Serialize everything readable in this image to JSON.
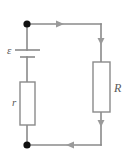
{
  "figure": {
    "name": "emf-circuit-diagram",
    "type": "electrical-circuit-schematic",
    "background_color": "#ffffff",
    "wire_color": "#8a8a8a",
    "node_color": "#101010",
    "arrow_color": "#9a9a9a",
    "label_color": "#5a5a5a"
  },
  "labels": {
    "emf": "ε",
    "internal_resistance": "r",
    "external_resistance": "R"
  },
  "components": [
    {
      "id": "battery",
      "name": "emf-source",
      "label": "ε",
      "branch": "left",
      "symbol": "battery-cell"
    },
    {
      "id": "internal-resistor",
      "name": "internal-resistance-resistor",
      "label": "r",
      "branch": "left",
      "symbol": "rectangle-resistor"
    },
    {
      "id": "external-resistor",
      "name": "external-resistance-resistor",
      "label": "R",
      "branch": "right",
      "symbol": "rectangle-resistor"
    }
  ],
  "nodes": [
    {
      "id": "top-left-node",
      "name": "junction-dot-top-left",
      "x": 27,
      "y": 24,
      "radius": 3.6
    },
    {
      "id": "bottom-left-node",
      "name": "junction-dot-bottom-left",
      "x": 27,
      "y": 145,
      "radius": 3.6
    }
  ],
  "current_arrows": [
    {
      "id": "top-arrow",
      "name": "current-arrow-top",
      "direction": "right",
      "x": 62,
      "y": 24
    },
    {
      "id": "right-upper-arrow",
      "name": "current-arrow-right-upper",
      "direction": "down",
      "x": 101,
      "y": 43
    },
    {
      "id": "right-lower-arrow",
      "name": "current-arrow-right-lower",
      "direction": "down",
      "x": 101,
      "y": 126
    },
    {
      "id": "bottom-arrow",
      "name": "current-arrow-bottom",
      "direction": "left",
      "x": 68,
      "y": 145
    }
  ],
  "geometry": {
    "left_rail_x": 27,
    "right_rail_x": 101,
    "top_wire_y": 24,
    "bottom_wire_y": 145,
    "battery_long_plate_y": 50,
    "battery_short_plate_y": 57,
    "internal_resistor_box": {
      "x": 20,
      "y": 82,
      "width": 15,
      "height": 43
    },
    "external_resistor_box": {
      "x": 93,
      "y": 62,
      "width": 17,
      "height": 50
    }
  }
}
